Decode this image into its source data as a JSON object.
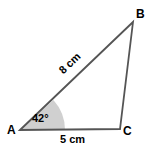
{
  "figure": {
    "type": "triangle-diagram",
    "background_color": "#ffffff",
    "stroke_color": "#555555",
    "angle_fill_color": "#d0d0d0",
    "text_color": "#000000"
  },
  "vertices": {
    "a": {
      "label": "A",
      "x": 20,
      "y": 130
    },
    "b": {
      "label": "B",
      "x": 133,
      "y": 22
    },
    "c": {
      "label": "C",
      "x": 120,
      "y": 129
    }
  },
  "sides": {
    "ab": {
      "label": "8 cm",
      "length": 8,
      "unit": "cm"
    },
    "ac": {
      "label": "5 cm",
      "length": 5,
      "unit": "cm"
    },
    "bc": {
      "label": "",
      "length": null,
      "unit": "cm"
    }
  },
  "angles": {
    "a": {
      "label": "42°",
      "value": 42,
      "unit": "degrees",
      "shaded": true
    }
  },
  "geometry": {
    "triangle_points": "20,130 133,22 120,129",
    "angle_wedge_path": "M 20 130 L 65 130 A 45 45 0 0 0 53.4 100.1 Z"
  }
}
